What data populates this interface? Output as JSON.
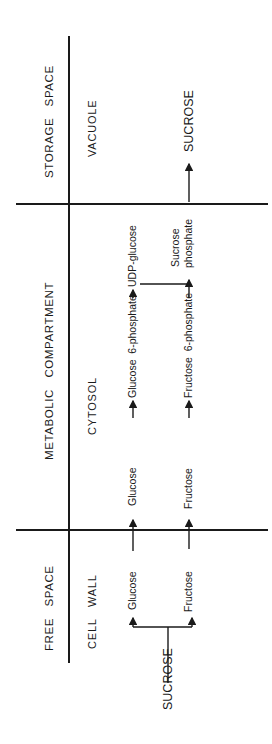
{
  "diagram": {
    "rows": [
      {
        "space": "STORAGE SPACE",
        "compartment": "VACUOLE"
      },
      {
        "space": "METABOLIC COMPARTMENT",
        "compartment": "CYTOSOL"
      },
      {
        "space": "FREE SPACE",
        "compartment": "CELL WALL"
      }
    ],
    "headers": {
      "storage": "STORAGE   SPACE",
      "metabolic": "METABOLIC   COMPARTMENT",
      "free": "FREE   SPACE"
    },
    "compartments": {
      "vacuole": "VACUOLE",
      "cytosol": "CYTOSOL",
      "cell_wall": "CELL   WALL"
    },
    "metabolites": {
      "sucrose_input": "SUCROSE",
      "glucose_wall": "Glucose",
      "fructose_wall": "Fructose",
      "glucose_cyto": "Glucose",
      "glucose_6p": "Glucose  6-phosphate",
      "udp_glucose": "UDP-glucose",
      "fructose_cyto": "Fructose",
      "fructose_6p": "Fructose  6-phosphate",
      "sucrose_phosphate_1": "Sucrose",
      "sucrose_phosphate_2": "phosphate",
      "sucrose_vacuole": "SUCROSE"
    },
    "pathway_edges": [
      [
        "SUCROSE",
        "Glucose (cell wall)"
      ],
      [
        "SUCROSE",
        "Fructose (cell wall)"
      ],
      [
        "Glucose (cell wall)",
        "Glucose (cytosol)"
      ],
      [
        "Fructose (cell wall)",
        "Fructose (cytosol)"
      ],
      [
        "Glucose (cytosol)",
        "Glucose 6-phosphate"
      ],
      [
        "Glucose 6-phosphate",
        "UDP-glucose"
      ],
      [
        "Fructose (cytosol)",
        "Fructose 6-phosphate"
      ],
      [
        "UDP-glucose + Fructose 6-phosphate",
        "Sucrose phosphate"
      ],
      [
        "Sucrose phosphate",
        "SUCROSE (vacuole)"
      ]
    ]
  }
}
